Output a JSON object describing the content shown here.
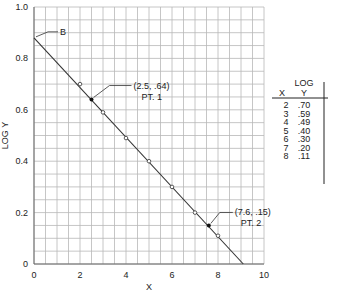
{
  "chart_data": {
    "type": "scatter",
    "title": "",
    "xlabel": "X",
    "ylabel": "LOG Y",
    "xlim": [
      0,
      10
    ],
    "ylim": [
      0,
      1.0
    ],
    "grid": true,
    "x_ticks": [
      "0",
      "2",
      "4",
      "6",
      "8",
      "10"
    ],
    "y_ticks": [
      "0",
      "0.2",
      "0.4",
      "0.6",
      "0.8",
      "1.0"
    ],
    "series": [
      {
        "name": "data points",
        "x": [
          2,
          3,
          4,
          5,
          6,
          7,
          8
        ],
        "y": [
          0.7,
          0.59,
          0.49,
          0.4,
          0.3,
          0.2,
          0.11
        ]
      }
    ],
    "fit_line": {
      "x": [
        0,
        9.1
      ],
      "y": [
        0.88,
        0
      ]
    },
    "annotations": [
      {
        "label": "B",
        "x": 0,
        "y": 0.88
      },
      {
        "label": "(2.5, .64)",
        "sublabel": "PT. 1",
        "x": 2.5,
        "y": 0.64
      },
      {
        "label": "(7.6, .15)",
        "sublabel": "PT. 2",
        "x": 7.6,
        "y": 0.15
      }
    ]
  },
  "table": {
    "col_x": "X",
    "col_y_top": "LOG",
    "col_y": "Y",
    "rows": [
      {
        "x": "2",
        "y": ".70"
      },
      {
        "x": "3",
        "y": ".59"
      },
      {
        "x": "4",
        "y": ".49"
      },
      {
        "x": "5",
        "y": ".40"
      },
      {
        "x": "6",
        "y": ".30"
      },
      {
        "x": "7",
        "y": ".20"
      },
      {
        "x": "8",
        "y": ".11"
      }
    ]
  }
}
